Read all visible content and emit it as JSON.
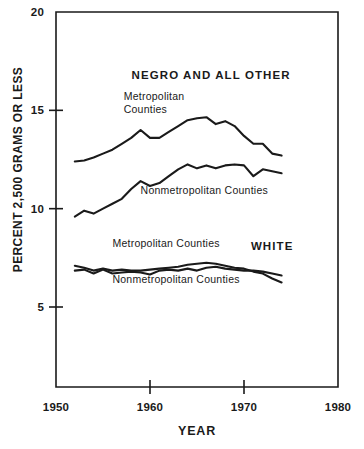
{
  "chart_data": {
    "type": "line",
    "title": "",
    "subtitle": "",
    "xlabel": "YEAR",
    "ylabel": "PERCENT 2,500 GRAMS OR LESS",
    "xlim": [
      1950,
      1980
    ],
    "ylim": [
      0,
      20
    ],
    "xticks": [
      1950,
      1960,
      1970,
      1980
    ],
    "yticks": [
      5,
      10,
      15,
      20
    ],
    "xtick_labels": [
      "1950",
      "1960",
      "1970",
      "1980"
    ],
    "ytick_labels": [
      "5",
      "10",
      "15",
      "20"
    ],
    "grid": false,
    "legend_position": "inline-annotations",
    "annotations": [
      {
        "id": "negro-and-all-other",
        "text": "NEGRO AND ALL OTHER",
        "x": 1966.5,
        "y": 16.6
      },
      {
        "id": "white",
        "text": "WHITE",
        "x": 1973.0,
        "y": 7.9
      }
    ],
    "x": [
      1952,
      1953,
      1954,
      1955,
      1956,
      1957,
      1958,
      1959,
      1960,
      1961,
      1962,
      1963,
      1964,
      1965,
      1966,
      1967,
      1968,
      1969,
      1970,
      1971,
      1972,
      1973,
      1974
    ],
    "series": [
      {
        "name": "Metropolitan Counties",
        "group": "NEGRO AND ALL OTHER",
        "label_lines": [
          "Metropolitan",
          "Counties"
        ],
        "label_x": 1957.2,
        "label_y": 15.55,
        "color": "#1a1a1a",
        "values": [
          12.4,
          12.45,
          12.6,
          12.8,
          13.0,
          13.3,
          13.6,
          14.0,
          13.6,
          13.6,
          13.9,
          14.2,
          14.5,
          14.6,
          14.65,
          14.3,
          14.45,
          14.2,
          13.7,
          13.3,
          13.3,
          12.8,
          12.7
        ]
      },
      {
        "name": "Nonmetropolitan Counties",
        "group": "NEGRO AND ALL OTHER",
        "label_lines": [
          "Nonmetropolitan  Counties"
        ],
        "label_x": 1959.0,
        "label_y": 10.75,
        "color": "#1a1a1a",
        "values": [
          9.6,
          9.9,
          9.75,
          10.0,
          10.25,
          10.5,
          11.0,
          11.4,
          11.15,
          11.3,
          11.65,
          12.0,
          12.25,
          12.05,
          12.2,
          12.05,
          12.2,
          12.25,
          12.2,
          11.65,
          12.0,
          11.9,
          11.8
        ]
      },
      {
        "name": "Metropolitan Counties",
        "group": "WHITE",
        "label_lines": [
          "Metropolitan Counties"
        ],
        "label_x": 1956.0,
        "label_y": 8.05,
        "color": "#1a1a1a",
        "values": [
          7.1,
          7.0,
          6.85,
          6.95,
          6.85,
          6.9,
          6.85,
          6.85,
          6.9,
          6.95,
          7.0,
          7.05,
          7.15,
          7.2,
          7.25,
          7.2,
          7.1,
          7.0,
          6.95,
          6.8,
          6.7,
          6.45,
          6.25
        ]
      },
      {
        "name": "Nonmetropolitan Counties",
        "group": "WHITE",
        "label_lines": [
          "Nonmetropolitan Counties"
        ],
        "label_x": 1956.0,
        "label_y": 6.2,
        "color": "#1a1a1a",
        "values": [
          6.85,
          6.9,
          6.7,
          6.9,
          6.7,
          6.75,
          6.8,
          6.75,
          6.65,
          6.85,
          6.9,
          6.85,
          6.95,
          6.85,
          7.0,
          7.05,
          6.95,
          6.9,
          6.85,
          6.85,
          6.8,
          6.7,
          6.6
        ]
      }
    ]
  }
}
